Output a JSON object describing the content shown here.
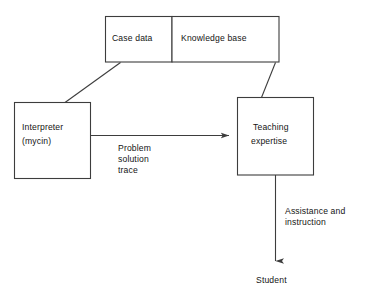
{
  "diagram": {
    "stroke_color": "#3d3d3d",
    "text_color": "#141414",
    "background_color": "#ffffff",
    "nodes": [
      {
        "id": "case-data",
        "label": "Case data",
        "shape": "rectangle"
      },
      {
        "id": "knowledge-base",
        "label": "Knowledge base",
        "shape": "rectangle"
      },
      {
        "id": "interpreter",
        "label_line1": "Interpreter",
        "label_line2": "(mycin)",
        "shape": "rectangle"
      },
      {
        "id": "teaching-expertise",
        "label_line1": "Teaching",
        "label_line2": "expertise",
        "shape": "rectangle"
      },
      {
        "id": "student",
        "label": "Student",
        "shape": "text"
      }
    ],
    "edges": [
      {
        "id": "case-data-to-interpreter",
        "from": "case-data",
        "to": "interpreter",
        "label": "",
        "arrowhead": false,
        "style": "diagonal"
      },
      {
        "id": "knowledge-base-to-teaching-expertise",
        "from": "knowledge-base",
        "to": "teaching-expertise",
        "label": "",
        "arrowhead": false,
        "style": "diagonal"
      },
      {
        "id": "interpreter-to-teaching-expertise",
        "from": "interpreter",
        "to": "teaching-expertise",
        "label_line1": "Problem",
        "label_line2": "solution",
        "label_line3": "trace",
        "arrowhead": true,
        "style": "horizontal"
      },
      {
        "id": "teaching-expertise-to-student",
        "from": "teaching-expertise",
        "to": "student",
        "label_line1": "Assistance and",
        "label_line2": "instruction",
        "arrowhead": true,
        "style": "vertical"
      }
    ]
  }
}
